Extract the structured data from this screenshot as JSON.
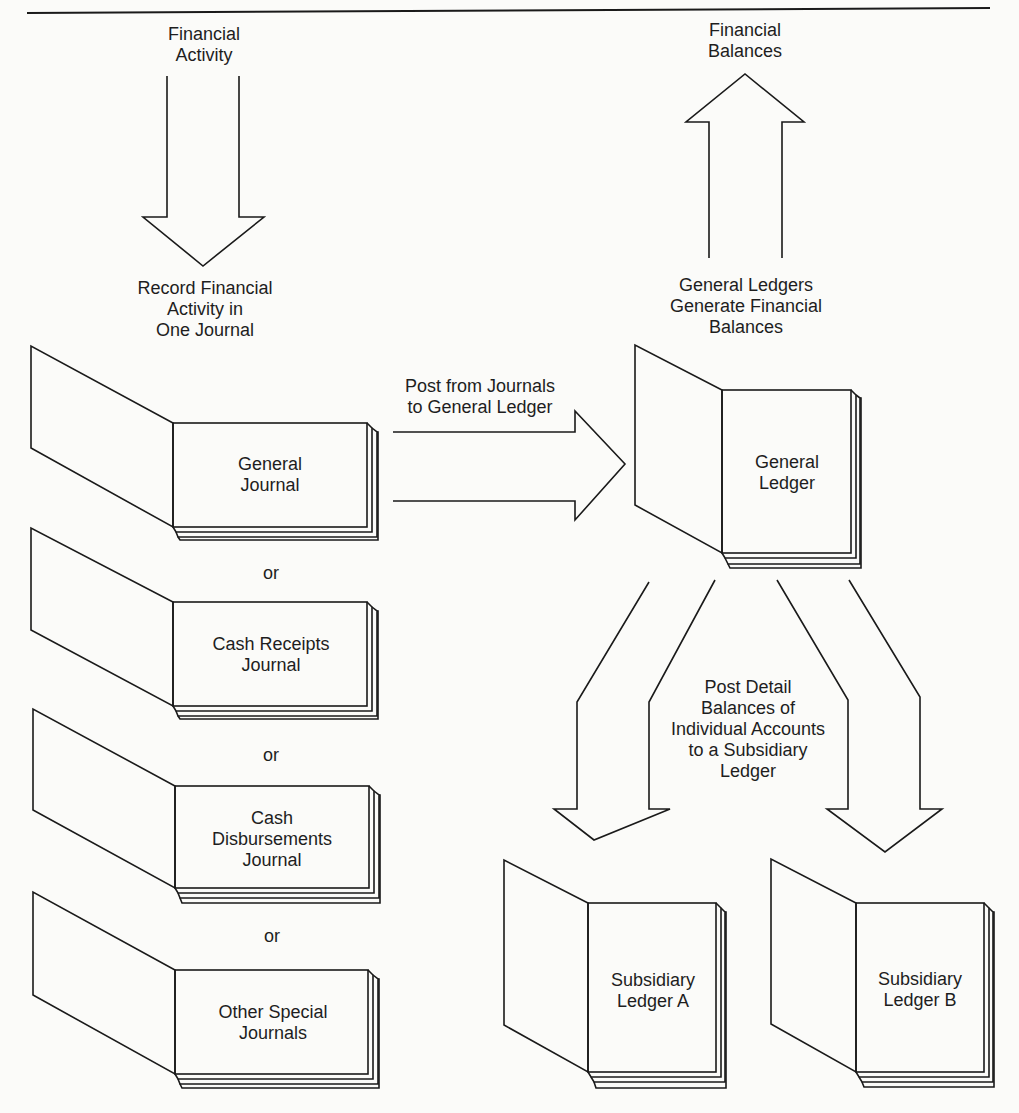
{
  "diagram": {
    "top_rule": true,
    "inputs": {
      "financial_activity": [
        "Financial",
        "Activity"
      ],
      "record_step": [
        "Record Financial",
        "Activity in",
        "One Journal"
      ]
    },
    "outputs": {
      "financial_balances": [
        "Financial",
        "Balances"
      ],
      "generate_step": [
        "General Ledgers",
        "Generate Financial",
        "Balances"
      ]
    },
    "journals": [
      {
        "name": [
          "General",
          "Journal"
        ]
      },
      {
        "name": [
          "Cash Receipts",
          "Journal"
        ]
      },
      {
        "name": [
          "Cash",
          "Disbursements",
          "Journal"
        ]
      },
      {
        "name": [
          "Other Special",
          "Journals"
        ]
      }
    ],
    "separator": "or",
    "post_to_ledger": [
      "Post from Journals",
      "to General Ledger"
    ],
    "general_ledger": [
      "General",
      "Ledger"
    ],
    "post_detail": [
      "Post Detail",
      "Balances of",
      "Individual Accounts",
      "to a Subsidiary",
      "Ledger"
    ],
    "subsidiary_ledgers": [
      {
        "name": [
          "Subsidiary",
          "Ledger A"
        ]
      },
      {
        "name": [
          "Subsidiary",
          "Ledger B"
        ]
      }
    ]
  }
}
